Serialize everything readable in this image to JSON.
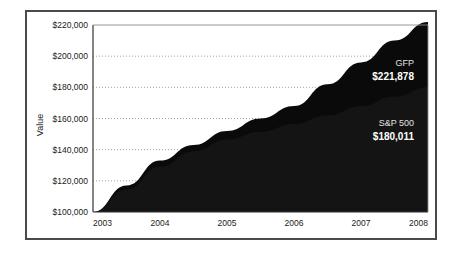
{
  "chart_data": {
    "type": "area",
    "title": "",
    "xlabel": "",
    "ylabel": "Value",
    "x": [
      2003,
      2004,
      2005,
      2006,
      2007,
      2008
    ],
    "xticklabels": [
      "2003",
      "2004",
      "2005",
      "2006",
      "2007",
      "2008"
    ],
    "xlim": [
      2003,
      2008
    ],
    "ylim": [
      100000,
      220000
    ],
    "yticks": [
      100000,
      120000,
      140000,
      160000,
      180000,
      200000,
      220000
    ],
    "yticklabels": [
      "$100,000",
      "$120,000",
      "$140,000",
      "$160,000",
      "$180,000",
      "$200,000",
      "$220,000"
    ],
    "grid": "horizontal-dotted",
    "legend_position": "inline-right",
    "stacked": false,
    "series": [
      {
        "name": "GFP",
        "end_label": "$221,878",
        "end_value": 221878,
        "color": "#0a0a0a",
        "values": [
          100000,
          133000,
          152000,
          168000,
          196000,
          221878
        ],
        "points": [
          {
            "x": 2003,
            "y": 100000
          },
          {
            "x": 2003.5,
            "y": 117000
          },
          {
            "x": 2004,
            "y": 133000
          },
          {
            "x": 2004.5,
            "y": 143000
          },
          {
            "x": 2005,
            "y": 152000
          },
          {
            "x": 2005.5,
            "y": 160000
          },
          {
            "x": 2006,
            "y": 168000
          },
          {
            "x": 2006.5,
            "y": 182000
          },
          {
            "x": 2007,
            "y": 196000
          },
          {
            "x": 2007.5,
            "y": 210000
          },
          {
            "x": 2008,
            "y": 221878
          }
        ]
      },
      {
        "name": "S&P 500",
        "end_label": "$180,011",
        "end_value": 180011,
        "color": "#141414",
        "values": [
          100000,
          129000,
          146500,
          156500,
          168000,
          180011
        ],
        "points": [
          {
            "x": 2003,
            "y": 100000
          },
          {
            "x": 2003.5,
            "y": 114500
          },
          {
            "x": 2004,
            "y": 129000
          },
          {
            "x": 2004.5,
            "y": 139000
          },
          {
            "x": 2005,
            "y": 146500
          },
          {
            "x": 2005.5,
            "y": 151500
          },
          {
            "x": 2006,
            "y": 156500
          },
          {
            "x": 2006.5,
            "y": 162000
          },
          {
            "x": 2007,
            "y": 168000
          },
          {
            "x": 2007.5,
            "y": 174000
          },
          {
            "x": 2008,
            "y": 180011
          }
        ]
      }
    ]
  },
  "figure": {
    "border_color": "#4a4a4a",
    "background": "#ffffff",
    "axis_color": "#333333",
    "grid_color": "#8c8c8c"
  }
}
